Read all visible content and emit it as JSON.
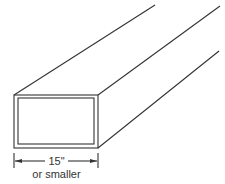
{
  "diagram": {
    "dimension": {
      "value": "15\"",
      "qualifier": "or smaller"
    },
    "colors": {
      "line": "#333333",
      "background": "#ffffff"
    }
  }
}
